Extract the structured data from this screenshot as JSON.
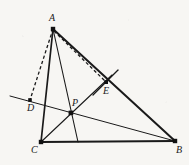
{
  "figure": {
    "background_color": "#f7f6f3",
    "stroke_color": "#1a1a1a",
    "accent_color": "#000000",
    "canvas": {
      "width": 189,
      "height": 165
    }
  },
  "points": [
    {
      "id": "A",
      "label": "A",
      "x": 53,
      "y": 29,
      "label_x": 49,
      "label_y": 13,
      "marker": true
    },
    {
      "id": "B",
      "label": "B",
      "x": 175,
      "y": 141,
      "label_x": 176,
      "label_y": 145,
      "marker": true
    },
    {
      "id": "C",
      "label": "C",
      "x": 41,
      "y": 142,
      "label_x": 31,
      "label_y": 145,
      "marker": true
    },
    {
      "id": "D",
      "label": "D",
      "x": 30,
      "y": 100,
      "label_x": 27,
      "label_y": 103,
      "marker": true
    },
    {
      "id": "E",
      "label": "E",
      "x": 106,
      "y": 82,
      "label_x": 103,
      "label_y": 86,
      "marker": true
    },
    {
      "id": "P",
      "label": "P",
      "x": 71,
      "y": 113,
      "label_x": 72,
      "label_y": 98,
      "marker": true
    }
  ],
  "segments": [
    {
      "id": "side-AB",
      "from": "A",
      "to": "B",
      "style": "solid",
      "width": 2.0
    },
    {
      "id": "side-BC",
      "from": "B",
      "to": "C",
      "style": "solid",
      "width": 2.0
    },
    {
      "id": "side-CA",
      "from": "C",
      "to": "A",
      "style": "solid",
      "width": 1.6
    },
    {
      "id": "cevian-A-to-BC",
      "from_xy": [
        53,
        29
      ],
      "to_xy": [
        78,
        142
      ],
      "style": "solid",
      "width": 1.1
    },
    {
      "id": "cevian-C-to-E",
      "from_xy": [
        41,
        142
      ],
      "to_xy": [
        112,
        75
      ],
      "style": "solid",
      "width": 1.1
    },
    {
      "id": "transversal-D-P-B",
      "from_xy": [
        10,
        96
      ],
      "to_xy": [
        175,
        141
      ],
      "style": "solid",
      "width": 1.0
    },
    {
      "id": "dashed-A-to-D",
      "from_xy": [
        53,
        29
      ],
      "to_xy": [
        30,
        100
      ],
      "style": "dashed",
      "width": 1.2
    },
    {
      "id": "dashed-A-to-E",
      "from_xy": [
        53,
        29
      ],
      "to_xy": [
        107,
        82
      ],
      "style": "dashed",
      "width": 1.2
    },
    {
      "id": "tick-through-E",
      "from_xy": [
        93,
        95
      ],
      "to_xy": [
        118,
        70
      ],
      "style": "solid",
      "width": 1.2
    }
  ],
  "labels": {
    "A": "A",
    "B": "B",
    "C": "C",
    "D": "D",
    "E": "E",
    "P": "P"
  }
}
